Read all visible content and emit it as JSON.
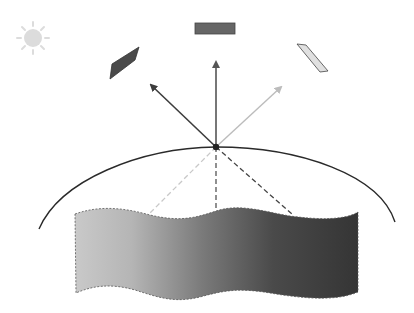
{
  "diagram": {
    "colors": {
      "background": "#ffffff",
      "sun": "#dcdcdc",
      "panel_dark": "#4a4a4a",
      "panel_mid": "#666666",
      "panel_light": "#dddddd",
      "arrow_dark": "#3d3d3d",
      "arrow_mid": "#555555",
      "arrow_light": "#bcbcbc",
      "dome": "#2a2a2a",
      "surface_gradient": [
        "#c8c8c8",
        "#8a8a8a",
        "#4a4a4a",
        "#333333"
      ]
    },
    "elements": {
      "sun": {
        "cx": 33,
        "cy": 38,
        "r": 9
      },
      "panels": [
        {
          "name": "left-panel",
          "shade": "dark"
        },
        {
          "name": "top-panel",
          "shade": "mid"
        },
        {
          "name": "right-panel",
          "shade": "light"
        }
      ],
      "origin_point": {
        "x": 216,
        "y": 147
      },
      "arrows": [
        {
          "name": "left-arrow",
          "to": [
            150,
            84
          ]
        },
        {
          "name": "up-arrow",
          "to": [
            216,
            60
          ]
        },
        {
          "name": "right-arrow",
          "to": [
            282,
            86
          ]
        }
      ],
      "dashed_lines": [
        {
          "name": "left-dashed",
          "to": [
            149,
            214
          ]
        },
        {
          "name": "center-dashed",
          "to": [
            216,
            214
          ]
        },
        {
          "name": "right-dashed",
          "to": [
            293,
            215
          ]
        }
      ]
    }
  }
}
